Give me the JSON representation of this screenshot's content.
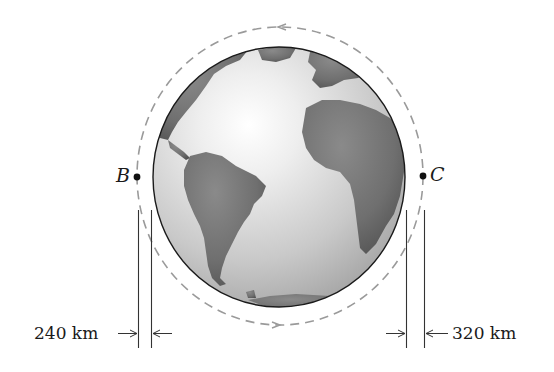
{
  "figure": {
    "type": "orbit-diagram",
    "colors": {
      "background": "#ffffff",
      "ink": "#1a1a1a",
      "orbit_dash": "#9a9a9a",
      "ocean_light": "#f4f4f4",
      "ocean_mid": "#bdbdbd",
      "land": "#6e6e6e"
    },
    "points": [
      {
        "id": "B",
        "label": "B",
        "side": "left"
      },
      {
        "id": "C",
        "label": "C",
        "side": "right"
      }
    ],
    "dimensions": [
      {
        "id": "perigee-altitude",
        "label": "240 km",
        "side": "left"
      },
      {
        "id": "apogee-altitude",
        "label": "320 km",
        "side": "right"
      }
    ],
    "orbit": {
      "style": "dashed",
      "direction_arrows": [
        "top: pointing left",
        "bottom: pointing right"
      ],
      "direction": "counterclockwise"
    },
    "earth": {
      "view": "Atlantic hemisphere (Americas, Europe, Africa)"
    }
  }
}
